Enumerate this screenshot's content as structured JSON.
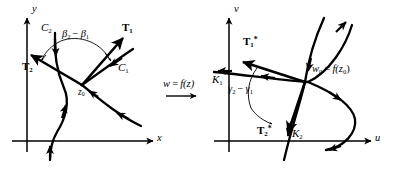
{
  "figure": {
    "background_color": "#ffffff",
    "stroke_color": "#000000",
    "width": 396,
    "height": 170
  },
  "left_panel": {
    "name": "z-plane",
    "axes": {
      "x_label": "x",
      "y_label": "y"
    },
    "curves": [
      {
        "id": "C1",
        "label": "C₁",
        "label_text": "C",
        "label_sub": "1"
      },
      {
        "id": "C2",
        "label": "C₂",
        "label_text": "C",
        "label_sub": "2"
      }
    ],
    "tangent_vectors": [
      {
        "id": "T1",
        "label_text": "T",
        "label_sub": "1"
      },
      {
        "id": "T2",
        "label_text": "T",
        "label_sub": "2"
      }
    ],
    "angle_label": {
      "beta2": "β",
      "beta2_sub": "2",
      "minus": "−",
      "beta1": "β",
      "beta1_sub": "1",
      "full": "β₂ − β₁"
    },
    "point": {
      "label_text": "z",
      "label_sub": "0",
      "full": "z₀"
    }
  },
  "mapping": {
    "label_w": "w",
    "label_eq": "=",
    "label_f": "f",
    "label_arg": "(z)",
    "full": "w = f(z)",
    "arrow_direction": "right"
  },
  "right_panel": {
    "name": "w-plane",
    "axes": {
      "x_label": "u",
      "y_label": "v"
    },
    "curves": [
      {
        "id": "K1",
        "label_text": "K",
        "label_sub": "1",
        "full": "K₁"
      },
      {
        "id": "K2",
        "label_text": "K",
        "label_sub": "2",
        "full": "K₂"
      }
    ],
    "tangent_vectors": [
      {
        "id": "T1star",
        "label_text": "T",
        "label_sub": "1",
        "label_sup": "*",
        "full": "T₁*"
      },
      {
        "id": "T2star",
        "label_text": "T",
        "label_sub": "2",
        "label_sup": "*",
        "full": "T₂*"
      }
    ],
    "angle_label": {
      "gamma2": "γ",
      "gamma2_sub": "2",
      "minus": "−",
      "gamma1": "γ",
      "gamma1_sub": "1",
      "full": "γ₂ − γ₁"
    },
    "point": {
      "w0": "w",
      "w0_sub": "0",
      "eq": "=",
      "f": "f",
      "arg_open": "(z",
      "arg_sub": "0",
      "arg_close": ")",
      "full": "w₀ = f(z₀)"
    }
  }
}
